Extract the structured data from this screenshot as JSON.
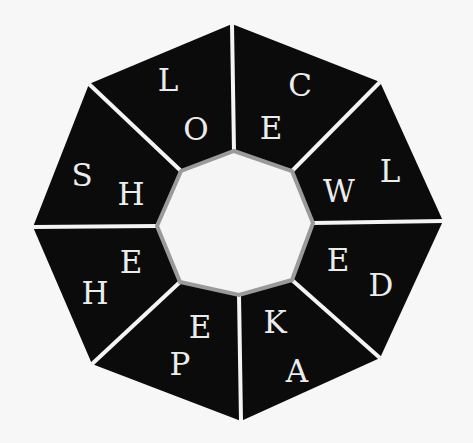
{
  "puzzle": {
    "type": "octagon-word-wheel",
    "colors": {
      "background": "#f7f7f7",
      "segment_fill": "#0b0b0b",
      "divider": "#f4f4f4",
      "inner_fill": "#f5f5f5",
      "inner_border": "#9a9a9a",
      "letter": "#ececec"
    },
    "outer_vertices": [
      [
        232,
        24
      ],
      [
        380,
        82
      ],
      [
        443,
        221
      ],
      [
        380,
        358
      ],
      [
        241,
        421
      ],
      [
        92,
        364
      ],
      [
        33,
        227
      ],
      [
        89,
        84
      ]
    ],
    "inner_vertices": [
      [
        234,
        151
      ],
      [
        292,
        171
      ],
      [
        313,
        223
      ],
      [
        292,
        280
      ],
      [
        239,
        295
      ],
      [
        180,
        282
      ],
      [
        157,
        226
      ],
      [
        181,
        171
      ]
    ],
    "segments": [
      {
        "id": "top-left",
        "outer_letter": "L",
        "inner_letter": "O",
        "outer_pos": [
          168,
          80
        ],
        "inner_pos": [
          196,
          129
        ]
      },
      {
        "id": "top-right",
        "outer_letter": "C",
        "inner_letter": "E",
        "outer_pos": [
          300,
          85
        ],
        "inner_pos": [
          271,
          128
        ]
      },
      {
        "id": "right-upper",
        "outer_letter": "L",
        "inner_letter": "W",
        "outer_pos": [
          390,
          171
        ],
        "inner_pos": [
          339,
          191
        ]
      },
      {
        "id": "right-lower",
        "outer_letter": "D",
        "inner_letter": "E",
        "outer_pos": [
          381,
          285
        ],
        "inner_pos": [
          338,
          260
        ]
      },
      {
        "id": "bottom-right",
        "outer_letter": "A",
        "inner_letter": "K",
        "outer_pos": [
          297,
          371
        ],
        "inner_pos": [
          275,
          322
        ]
      },
      {
        "id": "bottom-left",
        "outer_letter": "P",
        "inner_letter": "E",
        "outer_pos": [
          180,
          364
        ],
        "inner_pos": [
          200,
          327
        ]
      },
      {
        "id": "left-lower",
        "outer_letter": "H",
        "inner_letter": "E",
        "outer_pos": [
          95,
          293
        ],
        "inner_pos": [
          131,
          262
        ]
      },
      {
        "id": "left-upper",
        "outer_letter": "S",
        "inner_letter": "H",
        "outer_pos": [
          82,
          175
        ],
        "inner_pos": [
          131,
          194
        ]
      }
    ]
  }
}
